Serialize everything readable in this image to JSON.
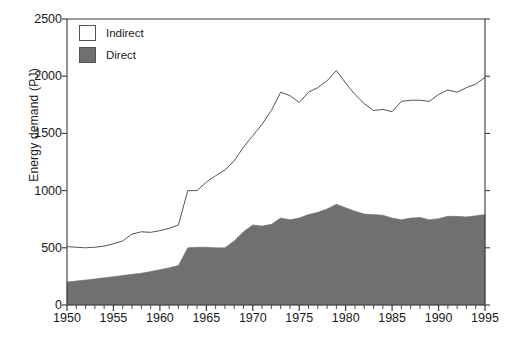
{
  "chart_data": {
    "type": "area",
    "title": "",
    "subtitle": "",
    "xlabel": "",
    "ylabel": "Energy demand (PJ)",
    "xlim": [
      1950,
      1995
    ],
    "ylim": [
      0,
      2500
    ],
    "ytick_values": [
      0,
      500,
      1000,
      1500,
      2000,
      2500
    ],
    "ytick_labels": [
      "0",
      "500",
      "1000",
      "1500",
      "2000",
      "2500"
    ],
    "xtick_values": [
      1950,
      1955,
      1960,
      1965,
      1970,
      1975,
      1980,
      1985,
      1990,
      1995
    ],
    "xtick_labels": [
      "1950",
      "1955",
      "1960",
      "1965",
      "1970",
      "1975",
      "1980",
      "1985",
      "1990",
      "1995"
    ],
    "x_minor_tick_step": 1,
    "grid": false,
    "stacked": true,
    "legend_position": "top-left-inside",
    "legend": [
      "Indirect",
      "Direct"
    ],
    "x": [
      1950,
      1951,
      1952,
      1953,
      1954,
      1955,
      1956,
      1957,
      1958,
      1959,
      1960,
      1961,
      1962,
      1963,
      1964,
      1965,
      1966,
      1967,
      1968,
      1969,
      1970,
      1971,
      1972,
      1973,
      1974,
      1975,
      1976,
      1977,
      1978,
      1979,
      1980,
      1981,
      1982,
      1983,
      1984,
      1985,
      1986,
      1987,
      1988,
      1989,
      1990,
      1991,
      1992,
      1993,
      1994,
      1995
    ],
    "series": [
      {
        "name": "Direct",
        "fill_color": "#707070",
        "values": [
          200,
          210,
          218,
          228,
          238,
          248,
          258,
          268,
          278,
          292,
          308,
          325,
          345,
          500,
          505,
          505,
          500,
          500,
          560,
          640,
          700,
          690,
          705,
          760,
          745,
          760,
          790,
          810,
          840,
          880,
          850,
          820,
          795,
          790,
          785,
          760,
          745,
          760,
          765,
          745,
          755,
          775,
          775,
          770,
          780,
          790
        ]
      },
      {
        "name": "Indirect",
        "fill_color": "#ffffff",
        "description": "Upper boundary line is the total (Direct + Indirect) energy demand",
        "total_values": [
          510,
          505,
          500,
          505,
          515,
          535,
          560,
          620,
          640,
          635,
          650,
          670,
          700,
          1000,
          1000,
          1075,
          1130,
          1180,
          1260,
          1380,
          1480,
          1580,
          1700,
          1860,
          1830,
          1770,
          1860,
          1900,
          1960,
          2050,
          1940,
          1840,
          1760,
          1700,
          1710,
          1690,
          1780,
          1790,
          1790,
          1780,
          1840,
          1880,
          1860,
          1900,
          1930,
          1990
        ]
      }
    ]
  },
  "axis": {
    "ylabel": "Energy demand (PJ)"
  },
  "legend": {
    "items": [
      {
        "label": "Indirect",
        "swatch": "white"
      },
      {
        "label": "Direct",
        "swatch": "gray"
      }
    ]
  },
  "colors": {
    "direct_fill": "#707070",
    "indirect_fill": "#ffffff",
    "line": "#555555",
    "axis": "#3a3a3a",
    "text": "#1a1a1a"
  }
}
